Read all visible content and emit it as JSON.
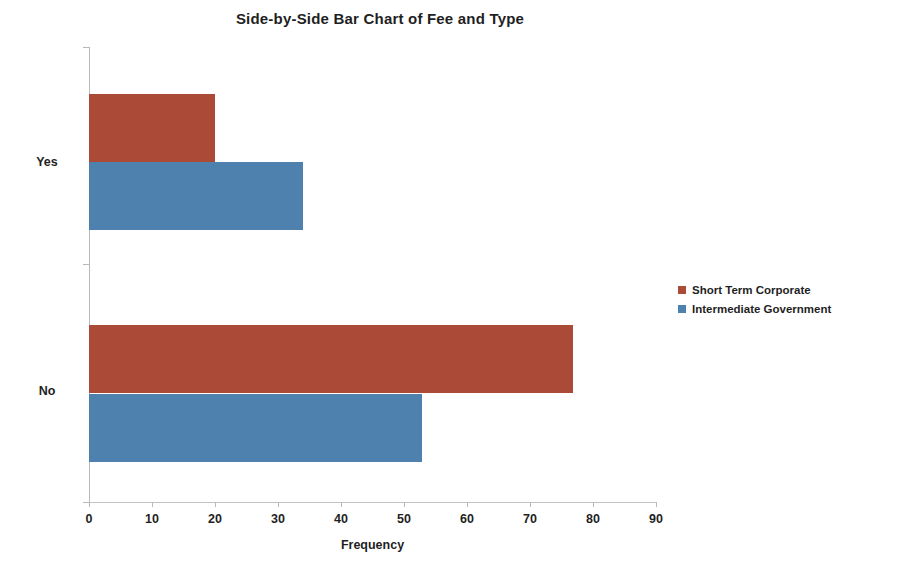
{
  "chart_data": {
    "type": "bar",
    "orientation": "horizontal",
    "title": "Side-by-Side Bar Chart of Fee and Type",
    "xlabel": "Frequency",
    "ylabel": "",
    "categories": [
      "Yes",
      "No"
    ],
    "series": [
      {
        "name": "Short Term Corporate",
        "color": "#AB4B37",
        "values": [
          20,
          77
        ]
      },
      {
        "name": "Intermediate Government",
        "color": "#4E81AE",
        "values": [
          34,
          53
        ]
      }
    ],
    "xlim": [
      0,
      90
    ],
    "xticks": [
      0,
      10,
      20,
      30,
      40,
      50,
      60,
      70,
      80,
      90
    ],
    "grid": false,
    "legend_position": "right"
  },
  "legend": {
    "items": [
      {
        "label": "Short Term Corporate",
        "color": "#AB4B37"
      },
      {
        "label": "Intermediate Government",
        "color": "#4E81AE"
      }
    ]
  }
}
